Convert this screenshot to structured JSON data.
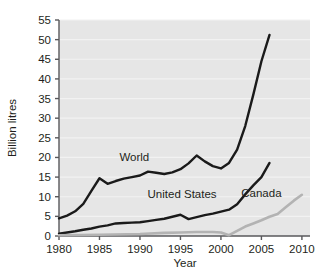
{
  "chart_data": {
    "type": "line",
    "title": "",
    "xlabel": "Year",
    "ylabel": "Billion litres",
    "xlim": [
      1980,
      2011
    ],
    "ylim": [
      0,
      55
    ],
    "xticks": [
      1980,
      1985,
      1990,
      1995,
      2000,
      2005,
      2010
    ],
    "yticks": [
      0,
      5,
      10,
      15,
      20,
      25,
      30,
      35,
      40,
      45,
      50,
      55
    ],
    "grid": true,
    "legend_position": "inline-labels",
    "plot_background": "#e6e6e6",
    "series": [
      {
        "name": "World",
        "color": "#1a1a1a",
        "label_x": 1989.3,
        "label_y": 19.2,
        "x": [
          1980,
          1981,
          1982,
          1983,
          1984,
          1985,
          1986,
          1987,
          1988,
          1989,
          1990,
          1991,
          1992,
          1993,
          1994,
          1995,
          1996,
          1997,
          1998,
          1999,
          2000,
          2001,
          2002,
          2003,
          2004,
          2005,
          2006
        ],
        "values": [
          4.5,
          5.2,
          6.3,
          8.2,
          11.5,
          14.7,
          13.3,
          14.0,
          14.6,
          15.0,
          15.4,
          16.4,
          16.1,
          15.8,
          16.2,
          17.0,
          18.5,
          20.5,
          19.0,
          17.8,
          17.2,
          18.6,
          22.0,
          28.0,
          36.0,
          44.5,
          51.2
        ]
      },
      {
        "name": "United States",
        "color": "#1a1a1a",
        "label_x": 1995.2,
        "label_y": 9.8,
        "x": [
          1980,
          1981,
          1982,
          1983,
          1984,
          1985,
          1986,
          1987,
          1988,
          1989,
          1990,
          1991,
          1992,
          1993,
          1994,
          1995,
          1996,
          1997,
          1998,
          1999,
          2000,
          2001,
          2002,
          2003,
          2004,
          2005,
          2006
        ],
        "values": [
          0.6,
          0.9,
          1.2,
          1.6,
          1.9,
          2.4,
          2.7,
          3.2,
          3.3,
          3.4,
          3.5,
          3.8,
          4.1,
          4.4,
          4.9,
          5.4,
          4.3,
          4.8,
          5.3,
          5.7,
          6.2,
          6.7,
          8.1,
          10.6,
          12.9,
          15.0,
          18.6
        ]
      },
      {
        "name": "Canada",
        "color": "#b3b3b3",
        "label_x": 2005.0,
        "label_y": 10.0,
        "x": [
          1980,
          1985,
          1990,
          1993,
          1995,
          1997,
          1999,
          2000,
          2001,
          2002,
          2003,
          2004,
          2005,
          2006,
          2007,
          2008,
          2009,
          2010
        ],
        "values": [
          0.2,
          0.3,
          0.5,
          0.8,
          0.9,
          1.0,
          1.0,
          0.9,
          0.2,
          1.3,
          2.4,
          3.2,
          4.0,
          4.9,
          5.6,
          7.3,
          9.0,
          10.5
        ]
      }
    ]
  },
  "axis": {
    "y_title": "Billion litres",
    "x_title": "Year",
    "y_tick_labels": [
      "55",
      "50",
      "45",
      "40",
      "35",
      "30",
      "25",
      "20",
      "15",
      "10",
      "5",
      "0"
    ],
    "x_tick_labels": [
      "1980",
      "1985",
      "1990",
      "1995",
      "2000",
      "2005",
      "2010"
    ]
  },
  "series_labels": {
    "world": "World",
    "united_states": "United States",
    "canada": "Canada"
  }
}
